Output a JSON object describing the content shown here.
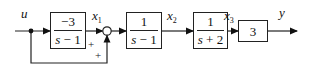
{
  "diagram": {
    "type": "block-diagram",
    "signals": {
      "input": "u",
      "x1": {
        "base": "x",
        "sub": "1"
      },
      "x2": {
        "base": "x",
        "sub": "2"
      },
      "x3": {
        "base": "x",
        "sub": "3"
      },
      "output": "y"
    },
    "blocks": [
      {
        "id": "G1",
        "numerator": "−3",
        "denominator_var": "s",
        "denominator_rest": " − 1"
      },
      {
        "id": "G2",
        "numerator": "1",
        "denominator_var": "s",
        "denominator_rest": " − 1"
      },
      {
        "id": "G3",
        "numerator": "1",
        "denominator_var": "s",
        "denominator_rest": " + 2"
      },
      {
        "id": "K",
        "gain": "3"
      }
    ],
    "summing_junction": {
      "signs": [
        "+",
        "+"
      ]
    },
    "colors": {
      "line": "#222222",
      "background": "#ffffff"
    }
  }
}
